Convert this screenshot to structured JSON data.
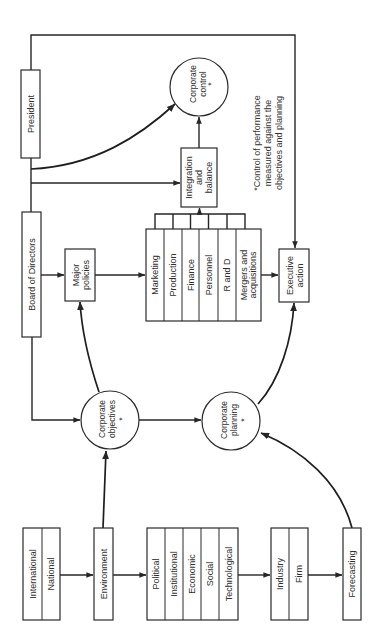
{
  "colors": {
    "background": "#ffffff",
    "line": "#2b2b2b",
    "text": "#2e2e2e"
  },
  "nodes": {
    "president": "President",
    "board_of_directors": "Board of Directors",
    "major_policies": [
      "Major",
      "policies"
    ],
    "functional_areas": [
      "Marketing",
      "Production",
      "Finance",
      "Personnel",
      "R and D",
      [
        "Mergers and",
        "acquisitions"
      ]
    ],
    "integration_and_balance": [
      "Integration",
      "and",
      "balance"
    ],
    "corporate_control": [
      "Corporate",
      "control",
      "*"
    ],
    "executive_action": [
      "Executive",
      "action"
    ],
    "corporate_objectives": [
      "Corporate",
      "objectives",
      "*"
    ],
    "corporate_planning": [
      "Corporate",
      "planning",
      "*"
    ],
    "levels": [
      "International",
      "National"
    ],
    "environment": "Environment",
    "environment_factors": [
      "Political",
      "Institutional",
      "Economic",
      "Social",
      "Technological"
    ],
    "scope": [
      "Industry",
      "Firm"
    ],
    "forecasting": "Forecasting"
  },
  "footnote": [
    "*Control of performance",
    "measured against the",
    "objectives and planning"
  ],
  "edges": [
    {
      "from": "President",
      "to": "Executive action"
    },
    {
      "from": "President",
      "to": "Corporate control"
    },
    {
      "from": "President",
      "to": "Integration and balance"
    },
    {
      "from": "Board of Directors",
      "to": "Major policies"
    },
    {
      "from": "Board of Directors",
      "to": "Corporate objectives"
    },
    {
      "from": "Major policies",
      "to": "Functional areas"
    },
    {
      "from": "Functional areas",
      "to": "Integration and balance"
    },
    {
      "from": "Functional areas",
      "to": "Executive action"
    },
    {
      "from": "Integration and balance",
      "to": "Corporate control"
    },
    {
      "from": "Corporate objectives",
      "to": "Major policies"
    },
    {
      "from": "Corporate objectives",
      "to": "Corporate planning"
    },
    {
      "from": "Corporate planning",
      "to": "Executive action"
    },
    {
      "from": "International / National",
      "to": "Environment"
    },
    {
      "from": "Environment",
      "to": "Corporate objectives"
    },
    {
      "from": "Environment",
      "to": "Environment factors"
    },
    {
      "from": "Environment factors",
      "to": "Industry / Firm"
    },
    {
      "from": "Industry / Firm",
      "to": "Forecasting"
    },
    {
      "from": "Forecasting",
      "to": "Corporate planning"
    }
  ]
}
